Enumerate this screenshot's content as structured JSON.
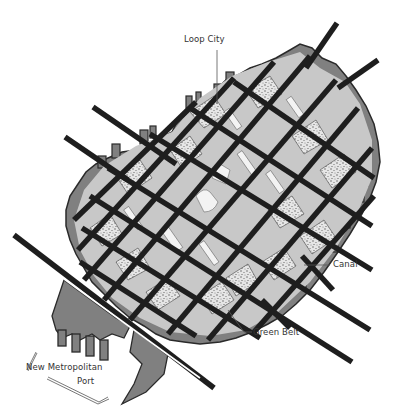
{
  "map": {
    "title": "Loop City plan",
    "labels": {
      "loop_city": "Loop City",
      "canal": "Canal",
      "green_belt": "Green Belt",
      "port_line1": "New Metropolitan",
      "port_line2": "Port"
    },
    "colors": {
      "background": "#ffffff",
      "street": "#1e1e1e",
      "block_light": "#c9c9c9",
      "block_mid": "#9a9a9a",
      "green_belt": "#7f7f7f",
      "park_texture": "#e4e4e4",
      "plaza": "#f4f4f4",
      "label_text": "#333333"
    }
  }
}
